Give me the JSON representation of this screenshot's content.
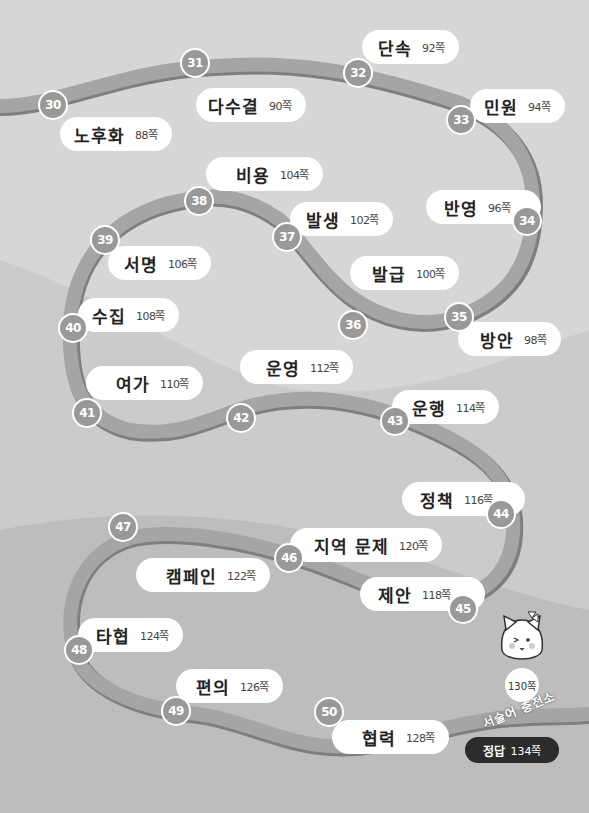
{
  "colors": {
    "background_top": "#d6d6d6",
    "background_mid": "#cbcbcb",
    "background_bottom": "#b5b5b5",
    "road": "#a3a3a3",
    "road_edge": "#7d7d7d",
    "badge": "#9a9a9a",
    "pill": "#ffffff",
    "answer_bg": "#2b2b2b"
  },
  "stops": [
    {
      "num": "30",
      "word": "노후화",
      "page": "88쪽"
    },
    {
      "num": "31",
      "word": "다수결",
      "page": "90쪽"
    },
    {
      "num": "32",
      "word": "단속",
      "page": "92쪽"
    },
    {
      "num": "33",
      "word": "민원",
      "page": "94쪽"
    },
    {
      "num": "34",
      "word": "반영",
      "page": "96쪽"
    },
    {
      "num": "35",
      "word": "방안",
      "page": "98쪽"
    },
    {
      "num": "36",
      "word": "발급",
      "page": "100쪽"
    },
    {
      "num": "37",
      "word": "발생",
      "page": "102쪽"
    },
    {
      "num": "38",
      "word": "비용",
      "page": "104쪽"
    },
    {
      "num": "39",
      "word": "서명",
      "page": "106쪽"
    },
    {
      "num": "40",
      "word": "수집",
      "page": "108쪽"
    },
    {
      "num": "41",
      "word": "여가",
      "page": "110쪽"
    },
    {
      "num": "42",
      "word": "운영",
      "page": "112쪽"
    },
    {
      "num": "43",
      "word": "운행",
      "page": "114쪽"
    },
    {
      "num": "44",
      "word": "정책",
      "page": "116쪽"
    },
    {
      "num": "45",
      "word": "제안",
      "page": "118쪽"
    },
    {
      "num": "46",
      "word": "지역 문제",
      "page": "120쪽"
    },
    {
      "num": "47",
      "word": "캠페인",
      "page": "122쪽"
    },
    {
      "num": "48",
      "word": "타협",
      "page": "124쪽"
    },
    {
      "num": "49",
      "word": "편의",
      "page": "126쪽"
    },
    {
      "num": "50",
      "word": "협력",
      "page": "128쪽"
    }
  ],
  "finale": {
    "page": "130쪽",
    "title": "서술어 충전소",
    "mascot": "cat-mascot"
  },
  "answer": {
    "label": "정답",
    "page": "134쪽"
  }
}
